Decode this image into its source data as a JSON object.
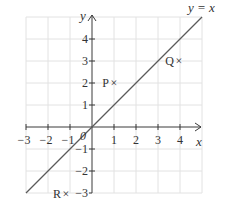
{
  "diagram": {
    "type": "coordinate-grid",
    "line_label": "y = x",
    "axes": {
      "x_label": "x",
      "y_label": "y",
      "origin_label": "0",
      "x_ticks": [
        "−3",
        "−2",
        "−1",
        "1",
        "2",
        "3",
        "4"
      ],
      "y_ticks": [
        "4",
        "3",
        "2",
        "1",
        "−1",
        "−2",
        "−3"
      ],
      "x_range": [
        -3,
        5
      ],
      "y_range": [
        -3,
        5
      ]
    },
    "points": [
      {
        "label": "P",
        "marker": "×",
        "x": 1,
        "y": 2
      },
      {
        "label": "Q",
        "marker": "×",
        "x": 4,
        "y": 3
      },
      {
        "label": "R",
        "marker": "×",
        "x": -1,
        "y": -3
      }
    ],
    "colors": {
      "grid": "#e2e2e2",
      "axis": "#3a3a3a",
      "line": "#5a5a5a",
      "text": "#333333"
    }
  }
}
